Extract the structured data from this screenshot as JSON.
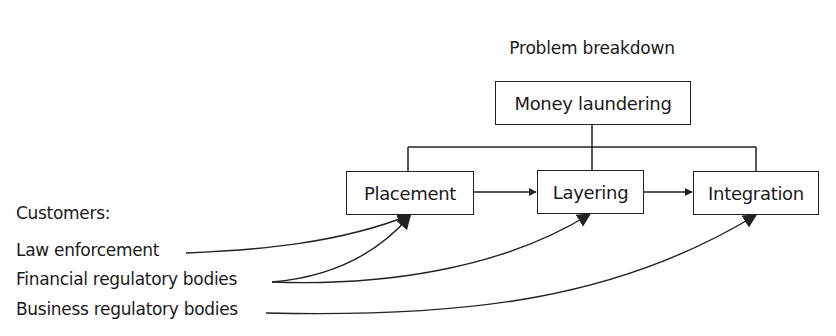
{
  "diagram": {
    "title": "Problem breakdown",
    "root": {
      "label": "Money laundering"
    },
    "stages": [
      {
        "label": "Placement"
      },
      {
        "label": "Layering"
      },
      {
        "label": "Integration"
      }
    ],
    "customers": {
      "heading": "Customers:",
      "items": [
        {
          "label": "Law enforcement",
          "targets": [
            "Placement"
          ]
        },
        {
          "label": "Financial regulatory bodies",
          "targets": [
            "Placement",
            "Layering"
          ]
        },
        {
          "label": "Business regulatory bodies",
          "targets": [
            "Integration"
          ]
        }
      ]
    },
    "colors": {
      "line": "#222222",
      "text": "#1a1a1a",
      "background": "#ffffff"
    }
  }
}
